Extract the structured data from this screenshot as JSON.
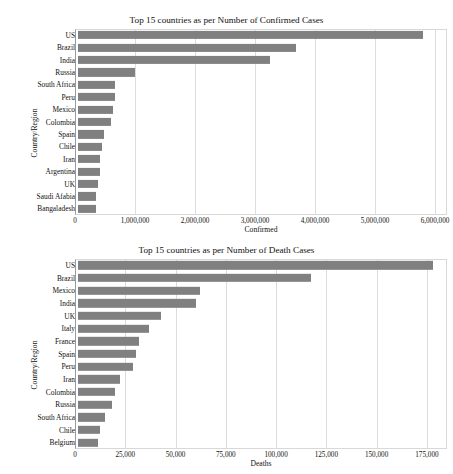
{
  "figure": {
    "background": "#ffffff",
    "bar_color": "#808080",
    "grid_color": "#dcdcdc",
    "axis_color": "#9a9a9a",
    "top_artifact_text": ""
  },
  "chart_data": [
    {
      "type": "bar",
      "orientation": "horizontal",
      "title": "Top 15 countries as per Number of Confirmed Cases",
      "xlabel": "Confirmed",
      "ylabel": "Country/Region",
      "categories": [
        "US",
        "Brazil",
        "India",
        "Russia",
        "South Africa",
        "Peru",
        "Mexico",
        "Colombia",
        "Spain",
        "Chile",
        "Iran",
        "Argentina",
        "UK",
        "Saudi Afabia",
        "Bangaladesh"
      ],
      "values": [
        5800000,
        3670000,
        3220000,
        960000,
        620000,
        620000,
        580000,
        560000,
        430000,
        405000,
        370000,
        370000,
        335000,
        310000,
        300000
      ],
      "xlim": [
        0,
        6200000
      ],
      "xticks": [
        0,
        1000000,
        2000000,
        3000000,
        4000000,
        5000000,
        6000000
      ],
      "xticklabels": [
        "0",
        "1,000,000",
        "2,000,000",
        "3,000,000",
        "4,000,000",
        "5,000,000",
        "6,000,000"
      ],
      "grid": true,
      "legend": false
    },
    {
      "type": "bar",
      "orientation": "horizontal",
      "title": "Top 15 countries as per Number of Death Cases",
      "xlabel": "Deaths",
      "ylabel": "Country/Region",
      "categories": [
        "US",
        "Brazil",
        "Mexico",
        "India",
        "UK",
        "Italy",
        "France",
        "Spain",
        "Peru",
        "Iran",
        "Colombia",
        "Russia",
        "South Africa",
        "Chile",
        "Belgium"
      ],
      "values": [
        178000,
        117000,
        61000,
        59000,
        41500,
        35400,
        30500,
        29000,
        27800,
        21000,
        18500,
        17000,
        13500,
        11200,
        9900
      ],
      "xlim": [
        0,
        185000
      ],
      "xticks": [
        0,
        25000,
        50000,
        75000,
        100000,
        125000,
        150000,
        175000
      ],
      "xticklabels": [
        "0",
        "25,000",
        "50,000",
        "75,000",
        "100,000",
        "125,000",
        "150,000",
        "175,000"
      ],
      "grid": true,
      "legend": false
    }
  ]
}
